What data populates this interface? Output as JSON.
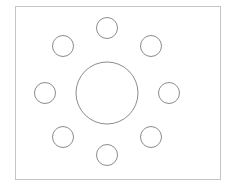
{
  "diagram": {
    "width": 228,
    "height": 185,
    "background": "#ffffff",
    "frame": {
      "x": 15,
      "y": 6,
      "width": 205,
      "height": 173,
      "stroke": "#c4c4c4",
      "stroke_width": 1
    },
    "center_circle": {
      "cx": 107,
      "cy": 93,
      "r": 31,
      "stroke": "#8c8c8c",
      "stroke_width": 1
    },
    "small_circle_style": {
      "r": 10.5,
      "stroke": "#8c8c8c",
      "stroke_width": 1
    },
    "small_circles": [
      {
        "name": "top",
        "cx": 107,
        "cy": 28
      },
      {
        "name": "top-right",
        "cx": 151,
        "cy": 46
      },
      {
        "name": "right",
        "cx": 169,
        "cy": 93
      },
      {
        "name": "bottom-right",
        "cx": 151,
        "cy": 137
      },
      {
        "name": "bottom",
        "cx": 107,
        "cy": 155
      },
      {
        "name": "bottom-left",
        "cx": 63,
        "cy": 137
      },
      {
        "name": "left",
        "cx": 45,
        "cy": 93
      },
      {
        "name": "top-left",
        "cx": 63,
        "cy": 46
      }
    ]
  }
}
